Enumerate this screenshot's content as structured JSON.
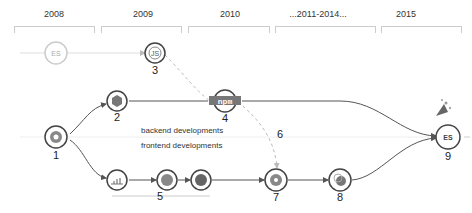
{
  "years": [
    {
      "label": "2008",
      "x": 28
    },
    {
      "label": "2009",
      "x": 117
    },
    {
      "label": "2010",
      "x": 204
    },
    {
      "label": "...2011-2014...",
      "x": 292
    },
    {
      "label": "2015",
      "x": 380
    }
  ],
  "lanes": {
    "backend_label": "backend developments",
    "frontend_label": "frontend developments"
  },
  "nodes": [
    {
      "id": "es-origin",
      "label": "ES",
      "number": ""
    },
    {
      "id": "n1",
      "number": "1",
      "icon": "chrome-v8-icon"
    },
    {
      "id": "n2",
      "number": "2",
      "icon": "nodejs-hexagon-icon"
    },
    {
      "id": "n3",
      "number": "3",
      "label": "JS",
      "icon": "commonjs-icon"
    },
    {
      "id": "n4",
      "number": "4",
      "label": "npm",
      "icon": "npm-icon"
    },
    {
      "id": "n5",
      "number": "5",
      "icon": "frontend-frameworks-group"
    },
    {
      "id": "n6",
      "number": "6"
    },
    {
      "id": "n7",
      "number": "7",
      "icon": "target-icon"
    },
    {
      "id": "n8",
      "number": "8",
      "icon": "build-tool-icon"
    },
    {
      "id": "n9",
      "number": "9",
      "label": "ES",
      "icon": "es2015-icon"
    }
  ],
  "colors": {
    "line": "#555555",
    "faint": "#cccccc",
    "dashed": "#bbbbbb",
    "node_fill": "#888888"
  }
}
